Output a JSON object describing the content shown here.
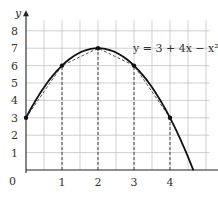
{
  "chart_data": {
    "type": "line",
    "title": "",
    "xlabel": "x",
    "ylabel": "y",
    "origin_label": "0",
    "xlim": [
      0,
      5
    ],
    "ylim": [
      0,
      8.5
    ],
    "grid": true,
    "x_ticks": [
      1,
      2,
      3,
      4
    ],
    "x_tick_labels": [
      "1",
      "2",
      "3",
      "4"
    ],
    "y_ticks": [
      1,
      2,
      3,
      4,
      5,
      6,
      7,
      8
    ],
    "y_tick_labels": [
      "1",
      "2",
      "3",
      "4",
      "5",
      "6",
      "7",
      "8"
    ],
    "annotation": "y = 3 + 4x − x²",
    "series": [
      {
        "name": "y = 3 + 4x - x^2",
        "style": "solid curve",
        "x": [
          0,
          0.5,
          1,
          1.5,
          2,
          2.5,
          3,
          3.5,
          4,
          4.5,
          4.65
        ],
        "y": [
          3,
          4.75,
          6,
          6.75,
          7,
          6.75,
          6,
          4.75,
          3,
          0.75,
          0
        ]
      },
      {
        "name": "chords",
        "style": "dashed",
        "x": [
          0,
          1,
          2,
          3,
          4
        ],
        "y": [
          3,
          6,
          7,
          6,
          3
        ]
      }
    ],
    "points": [
      {
        "x": 0,
        "y": 3
      },
      {
        "x": 1,
        "y": 6
      },
      {
        "x": 2,
        "y": 7
      },
      {
        "x": 3,
        "y": 6
      },
      {
        "x": 4,
        "y": 3
      }
    ],
    "ordinates": [
      1,
      2,
      3,
      4
    ]
  }
}
